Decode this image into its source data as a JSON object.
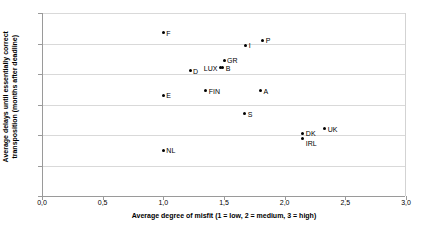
{
  "chart_data": {
    "type": "scatter",
    "title": "",
    "xlabel": "Average degree of misfit (1 = low, 2 = medium, 3 = high)",
    "ylabel_line1": "Average delays until essentially correct",
    "ylabel_line2": "transposition (months after deadline)",
    "xlim": [
      0,
      3
    ],
    "ylim": [
      0,
      60
    ],
    "xticks": [
      "0,0",
      "0,5",
      "1,0",
      "1,5",
      "2,0",
      "2,5",
      "3,0"
    ],
    "xtick_values": [
      0,
      0.5,
      1.0,
      1.5,
      2.0,
      2.5,
      3.0
    ],
    "yticks": [
      "0",
      "10",
      "20",
      "30",
      "40",
      "50",
      "60"
    ],
    "ytick_values": [
      0,
      10,
      20,
      30,
      40,
      50,
      60
    ],
    "grid": "horizontal",
    "legend": "none",
    "marker_color": "#000000",
    "gridline_color": "#d9d9d9",
    "points": [
      {
        "label": "F",
        "x": 1.0,
        "y": 53.5,
        "label_pos": "right"
      },
      {
        "label": "E",
        "x": 1.0,
        "y": 33.0,
        "label_pos": "right"
      },
      {
        "label": "NL",
        "x": 1.0,
        "y": 15.0,
        "label_pos": "right"
      },
      {
        "label": "D",
        "x": 1.22,
        "y": 41.0,
        "label_pos": "right"
      },
      {
        "label": "FIN",
        "x": 1.35,
        "y": 34.5,
        "label_pos": "right"
      },
      {
        "label": "LUX",
        "x": 1.47,
        "y": 42.0,
        "label_pos": "left"
      },
      {
        "label": "B",
        "x": 1.49,
        "y": 42.0,
        "label_pos": "right"
      },
      {
        "label": "GR",
        "x": 1.5,
        "y": 44.5,
        "label_pos": "right"
      },
      {
        "label": "S",
        "x": 1.67,
        "y": 27.0,
        "label_pos": "right"
      },
      {
        "label": "I",
        "x": 1.68,
        "y": 49.5,
        "label_pos": "right"
      },
      {
        "label": "A",
        "x": 1.8,
        "y": 34.5,
        "label_pos": "right"
      },
      {
        "label": "P",
        "x": 1.82,
        "y": 51.0,
        "label_pos": "right"
      },
      {
        "label": "DK",
        "x": 2.15,
        "y": 20.5,
        "label_pos": "right"
      },
      {
        "label": "IRL",
        "x": 2.15,
        "y": 19.0,
        "label_pos": "below"
      },
      {
        "label": "UK",
        "x": 2.33,
        "y": 22.0,
        "label_pos": "right"
      }
    ]
  }
}
